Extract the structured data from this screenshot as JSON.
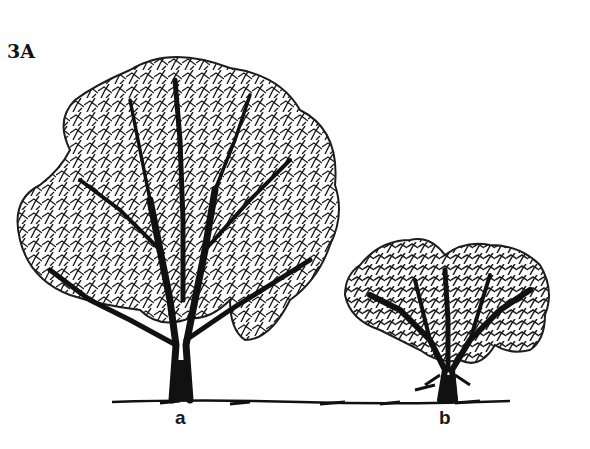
{
  "figure": {
    "label": "3A",
    "trees": [
      {
        "id": "a",
        "label": "a",
        "description": "large tree with rounded, spreading crown and single trunk"
      },
      {
        "id": "b",
        "label": "b",
        "description": "small shrub-like tree with broad, low crown and short trunk"
      }
    ],
    "ground_line": true,
    "colors": {
      "ink": "#111111",
      "background": "#ffffff"
    }
  }
}
